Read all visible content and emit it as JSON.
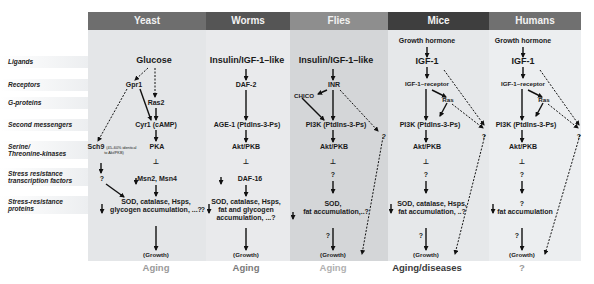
{
  "row_labels": [
    "Ligands",
    "Receptors",
    "G-proteins",
    "Second messengers",
    "Serine/",
    "Threonine-kinases",
    "Stress resistance",
    "transcription factors",
    "Stress-resistance",
    "proteins"
  ],
  "columns": {
    "yeast": {
      "header": "Yeast",
      "header_color": "#6e6e6e",
      "bg_color": "#e4e6e8",
      "ligand": "Glucose",
      "receptor": "Gpr1",
      "g_protein": "Ras2",
      "second_messenger": "Cyr1 (cAMP)",
      "kinase_main": "PKA",
      "kinase_side": "Sch9",
      "kinase_side_note_1": "(45–60% identical",
      "kinase_side_note_2": "to Akt/PKB)",
      "tf_side": "?",
      "tf": "Msn2, Msn4",
      "proteins_1": "SOD, catalase, Hsps,",
      "proteins_2": "glycogen accumulation, ...?",
      "growth": "(Growth)",
      "outcome": "Aging",
      "outcome_color": "#9a9a9a"
    },
    "worms": {
      "header": "Worms",
      "header_color": "#555555",
      "bg_color": "#e9eaec",
      "ligand": "Insulin/IGF-1–like",
      "receptor": "DAF-2",
      "second_messenger": "AGE-1 (PtdIns-3-Ps)",
      "kinase": "Akt/PKB",
      "tf": "DAF-16",
      "proteins_1": "SOD, catalase, Hsps,",
      "proteins_2": "fat and glycogen",
      "proteins_3": "accumulation, ...?",
      "side_q": "?",
      "growth": "(Growth)",
      "outcome": "Aging",
      "outcome_color": "#7a7a7a"
    },
    "flies": {
      "header": "Flies",
      "header_color": "#8e8e8e",
      "bg_color": "#d4d6d8",
      "ligand": "Insulin/IGF-1–like",
      "receptor": "INR",
      "adaptor": "CHICO",
      "second_messenger": "PI3K (PtdIns-3-Ps)",
      "dashed_q": "?",
      "kinase": "Akt/PKB",
      "tf": "?",
      "proteins_1": "SOD,",
      "proteins_2": "fat accumulation,..?",
      "growth_q": "?",
      "growth": "(Growth)",
      "outcome": "Aging",
      "outcome_color": "#b0b0b0"
    },
    "mice": {
      "header": "Mice",
      "header_color": "#3e3e3e",
      "bg_color": "#e6e8ea",
      "hormone": "Growth hormone",
      "ligand": "IGF-1",
      "receptor": "IGF-1–receptor",
      "g_protein": "Ras",
      "second_messenger": "PI3K (PtdIns-3-Ps)",
      "dashed_q": "?",
      "kinase": "Akt/PKB",
      "tf": "?",
      "proteins_1": "SOD, catalase, Hsps,",
      "proteins_2": "fat accumulation, ..?",
      "growth_q": "?",
      "growth": "(Growth)",
      "outcome": "Aging/diseases",
      "outcome_color": "#3a3a3a"
    },
    "humans": {
      "header": "Humans",
      "header_color": "#707070",
      "bg_color": "#eceef0",
      "hormone": "Growth hormone",
      "ligand": "IGF-1",
      "receptor": "IGF-1–receptor",
      "g_protein": "Ras",
      "second_messenger": "PI3K (PtdIns-3-Ps)",
      "dashed_q": "?",
      "kinase": "Akt/PKB",
      "tf": "?",
      "proteins_0": "?",
      "proteins_1": "fat accumulation",
      "growth_q": "?",
      "growth": "(Growth)",
      "outcome": "?",
      "outcome_color": "#9a9a9a"
    }
  },
  "inhibit_symbol": "⊥"
}
